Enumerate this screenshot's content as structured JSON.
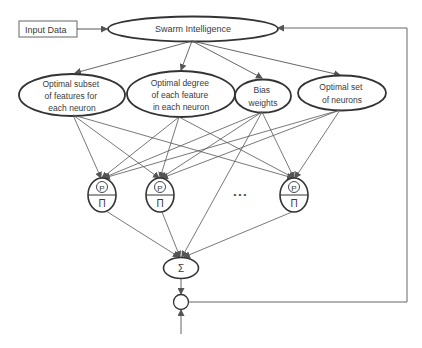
{
  "diagram": {
    "input_box": {
      "label": "Input Data"
    },
    "swarm": {
      "label": "Swarm Intelligence"
    },
    "parameters": [
      {
        "lines": [
          "Optimal subset",
          "of features for",
          "each neuron"
        ]
      },
      {
        "lines": [
          "Optimal degree",
          "of each feature",
          "in each neuron"
        ]
      },
      {
        "lines": [
          "Bias",
          "weights"
        ]
      },
      {
        "lines": [
          "Optimal set",
          "of neurons"
        ]
      }
    ],
    "neurons": [
      {
        "top_symbol": "P",
        "bottom_symbol": "Π"
      },
      {
        "top_symbol": "P",
        "bottom_symbol": "Π"
      },
      {
        "top_symbol": "P",
        "bottom_symbol": "Π"
      }
    ],
    "ellipsis": "• • •",
    "sum_node": {
      "symbol": "Σ"
    },
    "colors": {
      "stroke": "#333333",
      "text": "#3a3a3a",
      "line": "#555555"
    }
  }
}
